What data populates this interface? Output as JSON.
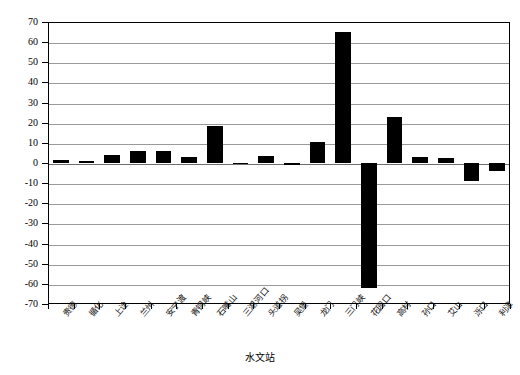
{
  "chart_data": {
    "type": "bar",
    "title": "",
    "xlabel": "水文站",
    "ylabel": "输沙量比例/%",
    "ylim": [
      -70,
      70
    ],
    "ytick_step": 10,
    "grid": true,
    "legend": "none",
    "bar_color": "#000000",
    "categories": [
      "贵德",
      "循化",
      "上诠",
      "兰州",
      "安宁渡",
      "青铜峡",
      "石嘴山",
      "三湖河口",
      "头道拐",
      "吴堡",
      "龙门",
      "三门峡",
      "花园口",
      "高村",
      "孙口",
      "艾山",
      "泺口",
      "利津"
    ],
    "values": [
      1.5,
      0.8,
      4.0,
      6.0,
      6.2,
      2.8,
      18.5,
      -0.6,
      3.5,
      -0.8,
      10.5,
      65.0,
      -62.0,
      23.0,
      3.0,
      2.5,
      -9.0,
      -4.0
    ],
    "yticks": [
      70,
      60,
      50,
      40,
      30,
      20,
      10,
      0,
      -10,
      -20,
      -30,
      -40,
      -50,
      -60,
      -70
    ],
    "ytick_labels": [
      "70",
      "60",
      "50",
      "40",
      "30",
      "20",
      "10",
      "0",
      "-10",
      "-20",
      "-30",
      "-40",
      "-50",
      "-60",
      "-70"
    ]
  }
}
